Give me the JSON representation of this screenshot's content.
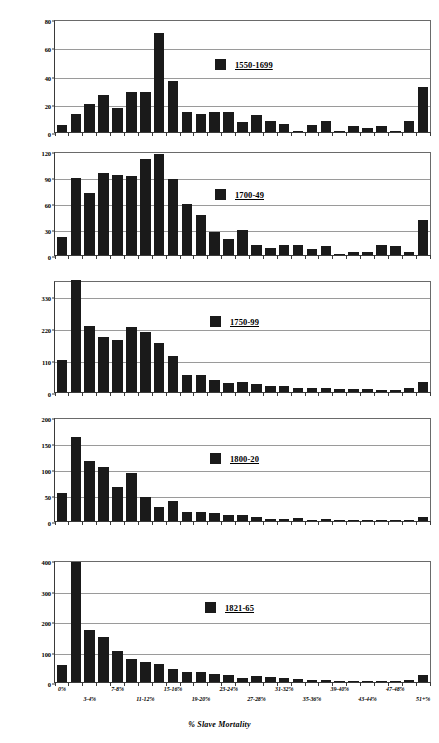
{
  "figure": {
    "xlabel": "% Slave Mortality",
    "ylabel": "Number of Ships",
    "bar_color": "#1a1a1a",
    "grid": true,
    "categories": [
      "0%",
      "1-2%",
      "3-4%",
      "5-6%",
      "7-8%",
      "9-10%",
      "11-12%",
      "13-14%",
      "15-16%",
      "17-18%",
      "19-20%",
      "21-22%",
      "23-24%",
      "25-26%",
      "27-28%",
      "29-30%",
      "31-32%",
      "33-34%",
      "35-36%",
      "37-38%",
      "39-40%",
      "41-42%",
      "43-44%",
      "45-46%",
      "47-48%",
      "49-50%",
      "51+%"
    ],
    "tick_labels": [
      "0%",
      "",
      "3-4%",
      "",
      "7-8%",
      "",
      "11-12%",
      "",
      "15-16%",
      "",
      "19-20%",
      "",
      "23-24%",
      "",
      "27-28%",
      "",
      "31-32%",
      "",
      "35-36%",
      "",
      "39-40%",
      "",
      "43-44%",
      "",
      "47-48%",
      "",
      "51+%"
    ]
  },
  "chart_data": [
    {
      "type": "bar",
      "title": "1550-1699",
      "legend": "1550-1699",
      "xlabel": "% Slave Mortality",
      "ylabel": "Number of Ships",
      "ylim": [
        0,
        80
      ],
      "yticks": [
        0,
        20,
        40,
        60,
        80
      ],
      "grid": true,
      "legend_position": "inside-center-right",
      "categories": [
        "0%",
        "1-2%",
        "3-4%",
        "5-6%",
        "7-8%",
        "9-10%",
        "11-12%",
        "13-14%",
        "15-16%",
        "17-18%",
        "19-20%",
        "21-22%",
        "23-24%",
        "25-26%",
        "27-28%",
        "29-30%",
        "31-32%",
        "33-34%",
        "35-36%",
        "37-38%",
        "39-40%",
        "41-42%",
        "43-44%",
        "45-46%",
        "47-48%",
        "49-50%",
        "51+%"
      ],
      "values": [
        5,
        13,
        20,
        26,
        17,
        28,
        28,
        70,
        36,
        14,
        13,
        14,
        14,
        7,
        12,
        8,
        6,
        1,
        5,
        8,
        1,
        4,
        3,
        4,
        1,
        8,
        32
      ]
    },
    {
      "type": "bar",
      "title": "1700-49",
      "legend": "1700-49",
      "xlabel": "% Slave Mortality",
      "ylabel": "Number of Ships",
      "ylim": [
        0,
        120
      ],
      "yticks": [
        0,
        30,
        60,
        90,
        120
      ],
      "grid": true,
      "legend_position": "inside-center-right",
      "categories": [
        "0%",
        "1-2%",
        "3-4%",
        "5-6%",
        "7-8%",
        "9-10%",
        "11-12%",
        "13-14%",
        "15-16%",
        "17-18%",
        "19-20%",
        "21-22%",
        "23-24%",
        "25-26%",
        "27-28%",
        "29-30%",
        "31-32%",
        "33-34%",
        "35-36%",
        "37-38%",
        "39-40%",
        "41-42%",
        "43-44%",
        "45-46%",
        "47-48%",
        "49-50%",
        "51+%"
      ],
      "values": [
        21,
        89,
        71,
        95,
        92,
        91,
        111,
        116,
        88,
        59,
        46,
        26,
        18,
        29,
        12,
        8,
        11,
        12,
        7,
        10,
        1,
        4,
        4,
        11,
        10,
        3,
        40
      ]
    },
    {
      "type": "bar",
      "title": "1750-99",
      "legend": "1750-99",
      "xlabel": "% Slave Mortality",
      "ylabel": "Number of Ships",
      "ylim": [
        0,
        385
      ],
      "yticks": [
        0,
        110,
        220,
        330
      ],
      "grid": true,
      "legend_position": "inside-center-right",
      "categories": [
        "0%",
        "1-2%",
        "3-4%",
        "5-6%",
        "7-8%",
        "9-10%",
        "11-12%",
        "13-14%",
        "15-16%",
        "17-18%",
        "19-20%",
        "21-22%",
        "23-24%",
        "25-26%",
        "27-28%",
        "29-30%",
        "31-32%",
        "33-34%",
        "35-36%",
        "37-38%",
        "39-40%",
        "41-42%",
        "43-44%",
        "45-46%",
        "47-48%",
        "49-50%",
        "51+%"
      ],
      "values": [
        109,
        385,
        228,
        188,
        180,
        223,
        205,
        170,
        124,
        59,
        59,
        41,
        31,
        36,
        29,
        19,
        22,
        15,
        14,
        13,
        11,
        12,
        11,
        7,
        7,
        13,
        35
      ]
    },
    {
      "type": "bar",
      "title": "1800-20",
      "legend": "1800-20",
      "xlabel": "% Slave Mortality",
      "ylabel": "Number of Ships",
      "ylim": [
        0,
        200
      ],
      "yticks": [
        0,
        50,
        100,
        150,
        200
      ],
      "grid": true,
      "legend_position": "inside-center-right",
      "categories": [
        "0%",
        "1-2%",
        "3-4%",
        "5-6%",
        "7-8%",
        "9-10%",
        "11-12%",
        "13-14%",
        "15-16%",
        "17-18%",
        "19-20%",
        "21-22%",
        "23-24%",
        "25-26%",
        "27-28%",
        "29-30%",
        "31-32%",
        "33-34%",
        "35-36%",
        "37-38%",
        "39-40%",
        "41-42%",
        "43-44%",
        "45-46%",
        "47-48%",
        "49-50%",
        "51+%"
      ],
      "values": [
        54,
        161,
        115,
        103,
        65,
        92,
        46,
        26,
        38,
        18,
        17,
        15,
        11,
        11,
        7,
        4,
        3,
        5,
        1,
        3,
        1,
        2,
        2,
        1,
        1,
        1,
        8
      ]
    },
    {
      "type": "bar",
      "title": "1821-65",
      "legend": "1821-65",
      "xlabel": "% Slave Mortality",
      "ylabel": "Number of Ships",
      "ylim": [
        0,
        400
      ],
      "yticks": [
        0,
        100,
        200,
        300,
        400
      ],
      "grid": true,
      "legend_position": "inside-center-right",
      "categories": [
        "0%",
        "1-2%",
        "3-4%",
        "5-6%",
        "7-8%",
        "9-10%",
        "11-12%",
        "13-14%",
        "15-16%",
        "17-18%",
        "19-20%",
        "21-22%",
        "23-24%",
        "25-26%",
        "27-28%",
        "29-30%",
        "31-32%",
        "33-34%",
        "35-36%",
        "37-38%",
        "39-40%",
        "41-42%",
        "43-44%",
        "45-46%",
        "47-48%",
        "49-50%",
        "51+%"
      ],
      "values": [
        56,
        393,
        171,
        148,
        103,
        75,
        65,
        60,
        42,
        34,
        32,
        27,
        24,
        13,
        19,
        18,
        12,
        9,
        5,
        8,
        2,
        4,
        3,
        1,
        1,
        5,
        22
      ]
    }
  ]
}
